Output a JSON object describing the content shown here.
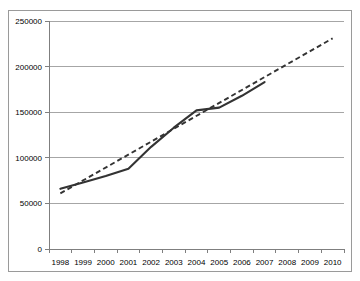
{
  "chart_data": {
    "type": "line",
    "title": "",
    "subtitle": "",
    "xlabel": "",
    "ylabel": "",
    "grid": "horizontal",
    "legend": "none",
    "categories": [
      "1998",
      "1999",
      "2000",
      "2001",
      "2002",
      "2003",
      "2004",
      "2005",
      "2006",
      "2007",
      "2008",
      "2009",
      "2010"
    ],
    "x": [
      1998,
      1999,
      2000,
      2001,
      2002,
      2003,
      2004,
      2005,
      2006,
      2007,
      2008,
      2009,
      2010
    ],
    "xlim": [
      1998,
      2010
    ],
    "ylim": [
      0,
      250000
    ],
    "ytick_labels": [
      "0",
      "50000",
      "100000",
      "150000",
      "200000",
      "250000"
    ],
    "ytick_values": [
      0,
      50000,
      100000,
      150000,
      200000,
      250000
    ],
    "series": [
      {
        "name": "observed",
        "style": "solid",
        "color": "#333333",
        "x": [
          1998,
          1999,
          2000,
          2001,
          2002,
          2003,
          2004,
          2005,
          2006,
          2007
        ],
        "values": [
          66000,
          73000,
          80000,
          88000,
          112000,
          133000,
          152000,
          155000,
          168000,
          183000
        ]
      },
      {
        "name": "trend",
        "style": "dashed",
        "color": "#333333",
        "x": [
          1998,
          2010
        ],
        "values": [
          61000,
          231000
        ]
      }
    ]
  }
}
